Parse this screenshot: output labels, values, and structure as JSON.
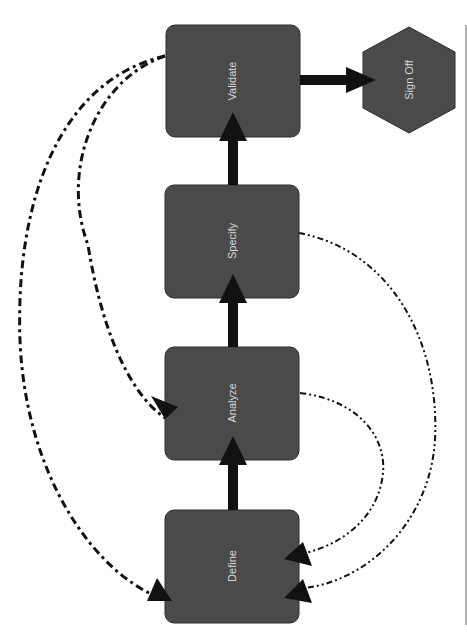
{
  "diagram": {
    "type": "flowchart",
    "orientation": "rotated-90",
    "colors": {
      "node_fill": "#4a4a4a",
      "node_stroke": "#2e2e2e",
      "label": "#d8d8d8",
      "edge": "#111111",
      "frame_line": "#9a9a9a"
    },
    "nodes": [
      {
        "id": "validate",
        "label": "Validate",
        "shape": "rounded-rect"
      },
      {
        "id": "signoff",
        "label": "Sign Off",
        "shape": "hexagon"
      },
      {
        "id": "specify",
        "label": "Specify",
        "shape": "rounded-rect"
      },
      {
        "id": "analyze",
        "label": "Analyze",
        "shape": "rounded-rect"
      },
      {
        "id": "define",
        "label": "Define",
        "shape": "rounded-rect"
      }
    ],
    "edges": [
      {
        "from": "define",
        "to": "analyze",
        "style": "solid-thick"
      },
      {
        "from": "analyze",
        "to": "specify",
        "style": "solid-thick"
      },
      {
        "from": "specify",
        "to": "validate",
        "style": "solid-thick"
      },
      {
        "from": "validate",
        "to": "signoff",
        "style": "solid-thick"
      },
      {
        "from": "validate",
        "to": "analyze",
        "style": "dash-dot"
      },
      {
        "from": "validate",
        "to": "define",
        "style": "dash-dot"
      },
      {
        "from": "specify",
        "to": "define",
        "style": "dash-dot-dot"
      },
      {
        "from": "analyze",
        "to": "define",
        "style": "dash-dot-dot"
      }
    ]
  }
}
